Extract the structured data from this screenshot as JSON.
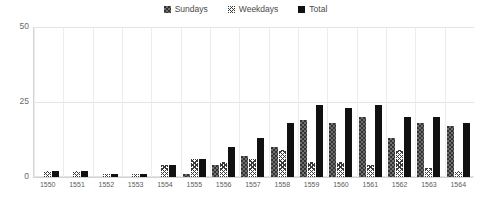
{
  "chart_data": {
    "type": "bar",
    "title": "",
    "subtitle": "",
    "xlabel": "",
    "ylabel": "",
    "ylim": [
      0,
      50
    ],
    "yticks": [
      0,
      25,
      50
    ],
    "ytick_labels": [
      "0",
      "25",
      "50"
    ],
    "grid": true,
    "legend_position": "top-center",
    "categories": [
      "1550",
      "1551",
      "1552",
      "1553",
      "1554",
      "1555",
      "1556",
      "1557",
      "1558",
      "1559",
      "1560",
      "1561",
      "1562",
      "1563",
      "1564"
    ],
    "series": [
      {
        "name": "Sundays",
        "pattern": "dotted-gray",
        "color": "#6f6f6f",
        "values": [
          0,
          0,
          0,
          0,
          0,
          1,
          4,
          7,
          10,
          19,
          18,
          20,
          13,
          18,
          17
        ]
      },
      {
        "name": "Weekdays",
        "pattern": "cross-hatch",
        "color": "#ffffff",
        "values": [
          2,
          2,
          1,
          1,
          4,
          6,
          5,
          6,
          9,
          5,
          5,
          4,
          9,
          3,
          2
        ]
      },
      {
        "name": "Total",
        "pattern": "solid-black",
        "color": "#111111",
        "values": [
          2,
          2,
          1,
          1,
          4,
          6,
          10,
          13,
          18,
          24,
          23,
          24,
          20,
          20,
          18
        ]
      }
    ]
  },
  "legend": {
    "items": [
      {
        "label": "Sundays"
      },
      {
        "label": "Weekdays"
      },
      {
        "label": "Total"
      }
    ]
  },
  "axis": {
    "y_top_label": "50",
    "y_mid_label": "25",
    "y_bottom_label": "0"
  }
}
